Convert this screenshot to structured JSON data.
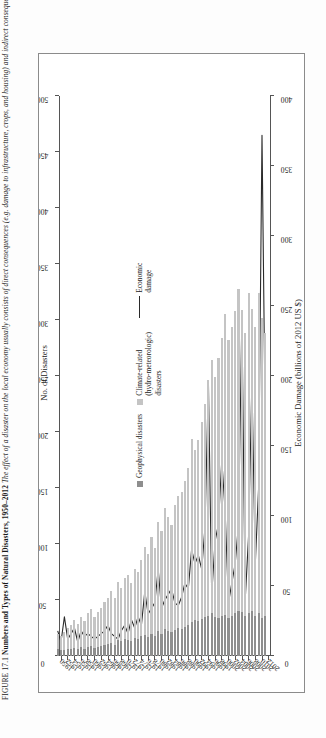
{
  "figure": {
    "label": "FIGURE 17.1",
    "title": "Numbers and Types of Natural Disasters, 1950–2012",
    "caption": "The effect of a disaster on the local economy usually consists of direct consequences (e.g. damage to infrastructure, crops, and housing) and indirect consequences (e.g. loss of revenues,"
  },
  "legend": {
    "geophysical": "Geophysical disasters",
    "climate": "Climate-related (hydro-meteorologic) disasters",
    "economic": "Economic damage"
  },
  "colors": {
    "geophysical": "#8e8e8e",
    "climate": "#c4c4c4",
    "line": "#2a2a2a",
    "axis": "#555555",
    "frame": "#8b8b8b"
  },
  "chart_data": {
    "type": "bar",
    "title": "Numbers and Types of Natural Disasters, 1950–2012",
    "orientation": "horizontal",
    "xlabel": "No. of Disasters",
    "xlabel_secondary": "Economic Damage (billions of 2012 US $)",
    "ylabel": "",
    "xlim": [
      0,
      500
    ],
    "xlim_secondary": [
      0,
      400
    ],
    "xticks": [
      0,
      50,
      100,
      150,
      200,
      250,
      300,
      350,
      400,
      450,
      500
    ],
    "xticks_secondary": [
      0,
      50,
      100,
      150,
      200,
      250,
      300,
      350,
      400
    ],
    "grid": false,
    "legend_position": "right",
    "categories": [
      1950,
      1951,
      1952,
      1953,
      1954,
      1955,
      1956,
      1957,
      1958,
      1959,
      1960,
      1961,
      1962,
      1963,
      1964,
      1965,
      1966,
      1967,
      1968,
      1969,
      1970,
      1971,
      1972,
      1973,
      1974,
      1975,
      1976,
      1977,
      1978,
      1979,
      1980,
      1981,
      1982,
      1983,
      1984,
      1985,
      1986,
      1987,
      1988,
      1989,
      1990,
      1991,
      1992,
      1993,
      1994,
      1995,
      1996,
      1997,
      1998,
      1999,
      2000,
      2001,
      2002,
      2003,
      2004,
      2005,
      2006,
      2007,
      2008,
      2009,
      2010,
      2011,
      2012
    ],
    "ytick_labels": [
      "1950",
      "1952",
      "1954",
      "1956",
      "1958",
      "1960",
      "1962",
      "1964",
      "1966",
      "1968",
      "1970",
      "1972",
      "1974",
      "1976",
      "1978",
      "1980",
      "1982",
      "1984",
      "1986",
      "1988",
      "1990",
      "1992",
      "1994",
      "1996",
      "1998",
      "2000",
      "2002",
      "2004",
      "2006",
      "2008",
      "2010",
      "2012"
    ],
    "series": [
      {
        "name": "Geophysical disasters",
        "color": "#8e8e8e",
        "stack": "disasters",
        "values": [
          6,
          5,
          5,
          6,
          6,
          7,
          6,
          8,
          6,
          8,
          9,
          7,
          8,
          9,
          10,
          11,
          12,
          10,
          14,
          13,
          15,
          14,
          13,
          16,
          15,
          18,
          19,
          17,
          20,
          18,
          22,
          20,
          24,
          22,
          21,
          23,
          25,
          24,
          26,
          28,
          30,
          32,
          31,
          33,
          35,
          36,
          38,
          35,
          34,
          36,
          37,
          34,
          36,
          38,
          40,
          39,
          36,
          38,
          40,
          36,
          38,
          34,
          36
        ]
      },
      {
        "name": "Climate-related (hydro-meteorologic) disasters",
        "color": "#c4c4c4",
        "stack": "disasters",
        "values": [
          14,
          13,
          16,
          19,
          22,
          25,
          23,
          27,
          25,
          30,
          33,
          28,
          31,
          34,
          38,
          41,
          46,
          42,
          52,
          48,
          55,
          58,
          52,
          62,
          60,
          68,
          78,
          74,
          86,
          78,
          98,
          92,
          108,
          102,
          96,
          112,
          118,
          122,
          130,
          140,
          164,
          152,
          162,
          176,
          190,
          210,
          226,
          214,
          232,
          248,
          268,
          248,
          258,
          270,
          288,
          270,
          252,
          286,
          270,
          258,
          286,
          268,
          252
        ]
      },
      {
        "name": "Economic damage",
        "color": "#2a2a2a",
        "type": "line",
        "axis": "secondary",
        "values": [
          18,
          10,
          28,
          12,
          16,
          20,
          10,
          18,
          14,
          16,
          14,
          12,
          14,
          16,
          18,
          22,
          16,
          14,
          12,
          18,
          22,
          16,
          26,
          20,
          28,
          22,
          46,
          30,
          34,
          38,
          62,
          34,
          40,
          44,
          48,
          38,
          36,
          42,
          52,
          48,
          76,
          66,
          72,
          62,
          92,
          196,
          44,
          82,
          94,
          140,
          104,
          38,
          52,
          66,
          94,
          242,
          40,
          86,
          196,
          66,
          120,
          372,
          160
        ]
      }
    ]
  }
}
